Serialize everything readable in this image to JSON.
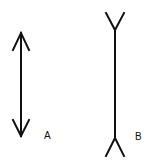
{
  "figure": {
    "line_color": "#111111",
    "background": "#ffffff",
    "figures": [
      {
        "id": "A",
        "label": "A",
        "type": "arrowheads-outward",
        "shaft": {
          "x": 21,
          "y1": 32,
          "y2": 137
        },
        "label_position": {
          "x": 44,
          "y": 131
        }
      },
      {
        "id": "B",
        "label": "B",
        "type": "fins-inward",
        "shaft": {
          "x": 115,
          "y1": 30,
          "y2": 138
        },
        "label_position": {
          "x": 135,
          "y": 132
        }
      }
    ]
  }
}
